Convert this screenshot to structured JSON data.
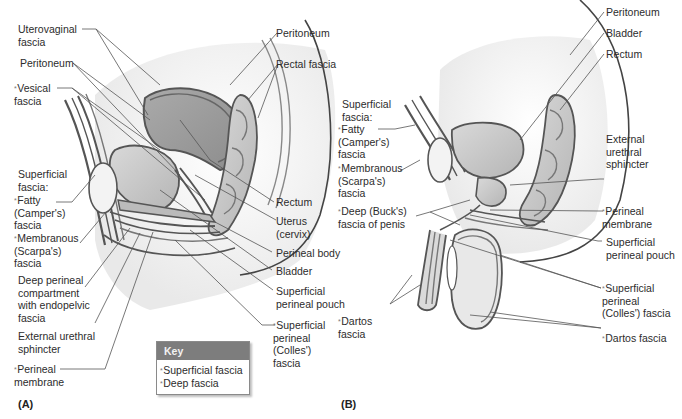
{
  "figure": {
    "panels": [
      {
        "id": "A",
        "label": "(A)",
        "subject": "female pelvis, sagittal section"
      },
      {
        "id": "B",
        "label": "(B)",
        "subject": "male pelvis, sagittal section"
      }
    ]
  },
  "panel_a": {
    "left_labels": [
      {
        "text": "Uterovaginal\nfascia",
        "marker": ""
      },
      {
        "text": "Peritoneum",
        "marker": ""
      },
      {
        "text": "Vesical\nfascia",
        "marker": "*"
      },
      {
        "text": "Superficial\nfascia:",
        "marker": ""
      },
      {
        "text": "Fatty\n(Camper's)\nfascia",
        "marker": "*"
      },
      {
        "text": "Membranous\n(Scarpa's)\nfascia",
        "marker": "*"
      },
      {
        "text": "Deep perineal\ncompartment\nwith endopelvic\nfascia",
        "marker": ""
      },
      {
        "text": "External urethral\nsphincter",
        "marker": ""
      },
      {
        "text": "Perineal\nmembrane",
        "marker": "*"
      }
    ],
    "right_labels": [
      {
        "text": "Peritoneum",
        "marker": ""
      },
      {
        "text": "Rectal fascia",
        "marker": ""
      },
      {
        "text": "Rectum",
        "marker": ""
      },
      {
        "text": "Uterus\n(cervix)",
        "marker": ""
      },
      {
        "text": "Perineal body",
        "marker": ""
      },
      {
        "text": "Bladder",
        "marker": ""
      },
      {
        "text": "Superficial\nperineal pouch",
        "marker": ""
      },
      {
        "text": "Superficial\nperineal\n(Colles')\nfascia",
        "marker": "*"
      }
    ]
  },
  "panel_b": {
    "left_labels": [
      {
        "text": "Superficial\nfascia:",
        "marker": ""
      },
      {
        "text": "Fatty\n(Camper's)\nfascia",
        "marker": "*"
      },
      {
        "text": "Membranous\n(Scarpa's)\nfascia",
        "marker": "*"
      },
      {
        "text": "Deep (Buck's)\nfascia of penis",
        "marker": "*"
      },
      {
        "text": "Dartos\nfascia",
        "marker": "*"
      }
    ],
    "right_labels": [
      {
        "text": "Peritoneum",
        "marker": ""
      },
      {
        "text": "Bladder",
        "marker": ""
      },
      {
        "text": "Rectum",
        "marker": ""
      },
      {
        "text": "External\nurethral\nsphincter",
        "marker": ""
      },
      {
        "text": "Perineal\nmembrane",
        "marker": "*"
      },
      {
        "text": "Superficial\nperineal pouch",
        "marker": ""
      },
      {
        "text": "Superficial\nperineal\n(Colles') fascia",
        "marker": "*"
      },
      {
        "text": "Dartos fascia",
        "marker": "*"
      }
    ]
  },
  "key": {
    "title": "Key",
    "items": [
      {
        "marker": "*",
        "text": "Superficial fascia"
      },
      {
        "marker": "*",
        "text": "Deep fascia"
      }
    ]
  },
  "colors": {
    "organ_fill": "#9a9a9a",
    "organ_fill_light": "#c8c8c8",
    "outline": "#555555",
    "leader_line": "#555555",
    "key_header": "#7d7d7d"
  }
}
